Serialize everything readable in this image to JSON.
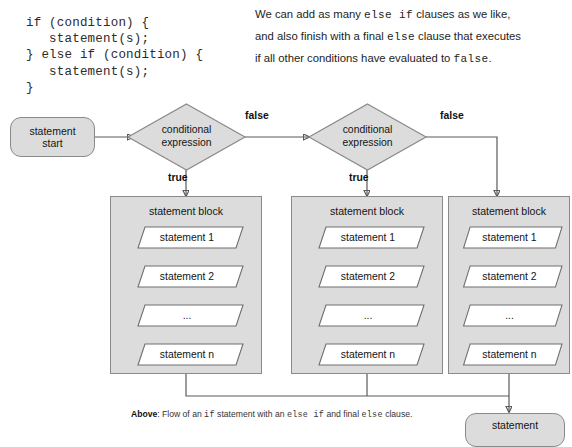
{
  "code_sample": {
    "lines": [
      "if (condition) {",
      "   statement(s);",
      "} else if (condition) {",
      "   statement(s);",
      "}"
    ],
    "text": "if (condition) {\n   statement(s);\n} else if (condition) {\n   statement(s);\n}"
  },
  "note": {
    "line1_a": "We can add as many ",
    "line1_code": "else if",
    "line1_b": " clauses as we like,",
    "line2_a": "and also finish with a final ",
    "line2_code": "else",
    "line2_b": " clause that executes",
    "line3_a": "if all other conditions have evaluated to ",
    "line3_code": "false",
    "line3_b": "."
  },
  "flowchart": {
    "start_node": {
      "line1": "statement",
      "line2": "start"
    },
    "end_node": {
      "line1": "statement"
    },
    "decisions": [
      {
        "line1": "conditional",
        "line2": "expression"
      },
      {
        "line1": "conditional",
        "line2": "expression"
      }
    ],
    "edge_labels": {
      "false_1": "false",
      "false_2": "false",
      "true_1": "true",
      "true_2": "true"
    },
    "blocks": [
      {
        "title": "statement block",
        "statements": [
          "statement 1",
          "statement 2",
          "...",
          "statement n"
        ]
      },
      {
        "title": "statement block",
        "statements": [
          "statement 1",
          "statement 2",
          "...",
          "statement n"
        ]
      },
      {
        "title": "statement block",
        "statements": [
          "statement 1",
          "statement 2",
          "...",
          "statement n"
        ]
      }
    ]
  },
  "caption": {
    "label": "Above",
    "part1": ": Flow of an ",
    "code1": "if",
    "part2": " statement with an ",
    "code2": "else if",
    "part3": " and final ",
    "code3": "else",
    "part4": " clause."
  },
  "colors": {
    "shape_fill": "#dcdcdc",
    "shape_stroke": "#8a8a8a",
    "wire": "#5a5a5a",
    "text": "#141414",
    "background": "#ffffff"
  }
}
